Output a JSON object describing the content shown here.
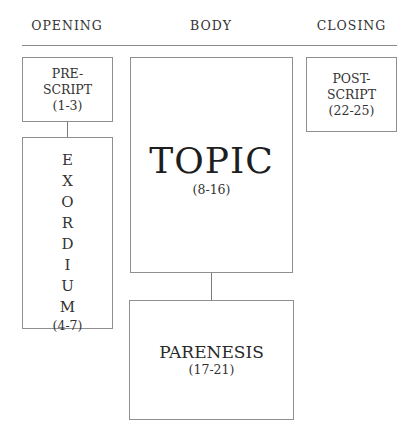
{
  "headers": {
    "opening": "OPENING",
    "body": "BODY",
    "closing": "CLOSING"
  },
  "prescript": {
    "line1": "PRE-",
    "line2": "SCRIPT",
    "range": "(1-3)"
  },
  "exordium": {
    "letters": [
      "E",
      "X",
      "O",
      "R",
      "D",
      "I",
      "U",
      "M"
    ],
    "range": "(4-7)"
  },
  "topic": {
    "label": "TOPIC",
    "range": "(8-16)"
  },
  "parenesis": {
    "label": "PARENESIS",
    "range": "(17-21)"
  },
  "postscript": {
    "line1": "POST-",
    "line2": "SCRIPT",
    "range": "(22-25)"
  },
  "colors": {
    "border": "#8f8f8f",
    "rule": "#8a8a8a",
    "text": "#2a2a2a"
  }
}
